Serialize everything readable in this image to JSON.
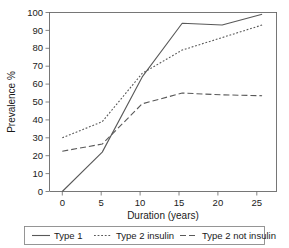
{
  "chart_data": {
    "type": "line",
    "title": "",
    "xlabel": "Duration (years)",
    "ylabel": "Prevalence %",
    "x": [
      0,
      5,
      10,
      15,
      20,
      25
    ],
    "xlim": [
      -1.6,
      26.8
    ],
    "ylim": [
      0,
      100
    ],
    "xticks": [
      0,
      5,
      10,
      15,
      20,
      25
    ],
    "xtick_labels": [
      "0",
      "5",
      "10",
      "15",
      "20",
      "25"
    ],
    "yticks": [
      0,
      10,
      20,
      30,
      40,
      50,
      60,
      70,
      80,
      90,
      100
    ],
    "ytick_labels": [
      "0",
      "10",
      "20",
      "30",
      "40",
      "50",
      "60",
      "70",
      "80",
      "90",
      "100"
    ],
    "grid": false,
    "legend_position": "below-outside",
    "series": [
      {
        "name": "Type 1",
        "style": "solid",
        "color": "#595959",
        "x": [
          0,
          5,
          10,
          15,
          20,
          25
        ],
        "values": [
          0,
          22,
          64,
          94,
          93,
          99
        ]
      },
      {
        "name": "Type 2 insulin",
        "style": "dotted",
        "color": "#595959",
        "x": [
          0,
          5,
          10,
          15,
          20,
          25
        ],
        "values": [
          30,
          39,
          66,
          79,
          86,
          93
        ]
      },
      {
        "name": "Type 2 not insulin",
        "style": "dashed",
        "color": "#595959",
        "x": [
          0,
          5,
          10,
          15,
          20,
          25
        ],
        "values": [
          22.5,
          26.5,
          49,
          55,
          54,
          53.5
        ]
      }
    ]
  },
  "axes": {
    "x_title": "Duration (years)",
    "y_title": "Prevalence %",
    "x_tick_0": "0",
    "x_tick_1": "5",
    "x_tick_2": "10",
    "x_tick_3": "15",
    "x_tick_4": "20",
    "x_tick_5": "25",
    "y_tick_0": "0",
    "y_tick_1": "10",
    "y_tick_2": "20",
    "y_tick_3": "30",
    "y_tick_4": "40",
    "y_tick_5": "50",
    "y_tick_6": "60",
    "y_tick_7": "70",
    "y_tick_8": "80",
    "y_tick_9": "90",
    "y_tick_10": "100"
  },
  "legend": {
    "items": [
      {
        "label": "Type 1",
        "style": "solid"
      },
      {
        "label": "Type 2 insulin",
        "style": "dotted"
      },
      {
        "label": "Type 2 not insulin",
        "style": "dashed"
      }
    ]
  },
  "style": {
    "line_color": "#595959",
    "frame_color": "#666666",
    "text_color": "#1a1a1a",
    "background": "#ffffff"
  }
}
